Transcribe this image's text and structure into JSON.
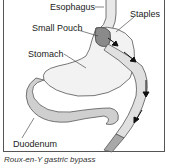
{
  "diagram": {
    "labels": {
      "esophagus": "Esophagus",
      "staples": "Staples",
      "small_pouch": "Small Pouch",
      "stomach": "Stomach",
      "duodenum": "Duodenum"
    },
    "caption": "Roux-en-Y gastric bypass",
    "colors": {
      "outline": "#555555",
      "pouch": "#8a8a8a",
      "intestine": "#cfcfcf",
      "roux_limb": "#a8a8a8"
    }
  }
}
